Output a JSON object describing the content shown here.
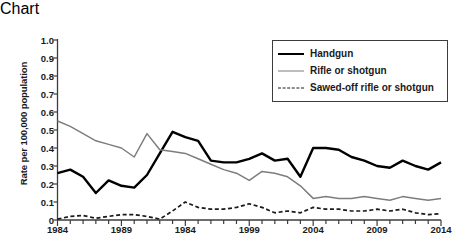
{
  "chart_data": {
    "type": "line",
    "title": "",
    "xlabel": "",
    "ylabel": "Rate per 100,000 population",
    "ylim": [
      0,
      1.0
    ],
    "xlim": [
      1984,
      2014
    ],
    "grid": false,
    "legend_position": "top-right",
    "y_ticks": [
      "1.0",
      "0.9",
      "0.8",
      "0.7",
      "0.6",
      "0.5",
      "0.4",
      "0.3",
      "0.2",
      "0.1",
      "0"
    ],
    "y_tick_values": [
      1.0,
      0.9,
      0.8,
      0.7,
      0.6,
      0.5,
      0.4,
      0.3,
      0.2,
      0.1,
      0
    ],
    "x_tick_labels": [
      "1984",
      "1989",
      "1984",
      "1999",
      "2004",
      "2009",
      "2014"
    ],
    "x_tick_values": [
      1984,
      1989,
      1994,
      1999,
      2004,
      2009,
      2014
    ],
    "x": [
      1984,
      1985,
      1986,
      1987,
      1988,
      1989,
      1990,
      1991,
      1992,
      1993,
      1994,
      1995,
      1996,
      1997,
      1998,
      1999,
      2000,
      2001,
      2002,
      2003,
      2004,
      2005,
      2006,
      2007,
      2008,
      2009,
      2010,
      2011,
      2012,
      2013,
      2014
    ],
    "series": [
      {
        "name": "Handgun",
        "color": "#000000",
        "style": "solid-thick",
        "values": [
          0.26,
          0.28,
          0.24,
          0.15,
          0.22,
          0.19,
          0.18,
          0.25,
          0.37,
          0.49,
          0.46,
          0.44,
          0.33,
          0.32,
          0.32,
          0.34,
          0.37,
          0.33,
          0.34,
          0.24,
          0.3,
          0.36,
          0.36,
          0.33,
          0.32,
          0.35,
          0.36,
          0.36,
          0.42,
          0.35,
          0.38
        ]
      },
      {
        "name": "Rifle or shotgun",
        "color": "#7d7d7d",
        "style": "solid-thin",
        "values": [
          0.55,
          0.52,
          0.48,
          0.44,
          0.42,
          0.4,
          0.35,
          0.48,
          0.39,
          0.38,
          0.37,
          0.34,
          0.31,
          0.28,
          0.26,
          0.22,
          0.27,
          0.26,
          0.24,
          0.19,
          0.18,
          0.2,
          0.2,
          0.17,
          0.15,
          0.13,
          0.12,
          0.14,
          0.19,
          0.13,
          0.12
        ]
      },
      {
        "name": "Sawed-off rifle or shotgun",
        "color": "#1a1a1a",
        "style": "dashed",
        "values": [
          0.005,
          0.02,
          0.025,
          0.01,
          0.02,
          0.03,
          0.03,
          0.02,
          0.005,
          0.05,
          0.1,
          0.07,
          0.06,
          0.06,
          0.07,
          0.09,
          0.07,
          0.04,
          0.05,
          0.04,
          0.05,
          0.03,
          0.03,
          0.02,
          0.02,
          0.03,
          0.05,
          0.06,
          0.04,
          0.07,
          0.09
        ]
      }
    ],
    "series_tail": {
      "Handgun": [
        0.4,
        0.4,
        0.39,
        0.35,
        0.33,
        0.3,
        0.29,
        0.33,
        0.3,
        0.28,
        0.32
      ],
      "Rifle or shotgun": [
        0.12,
        0.13,
        0.12,
        0.12,
        0.13,
        0.12,
        0.11,
        0.13,
        0.12,
        0.11,
        0.12
      ],
      "Sawed-off rifle or shotgun": [
        0.07,
        0.06,
        0.06,
        0.05,
        0.05,
        0.06,
        0.05,
        0.06,
        0.04,
        0.03,
        0.035
      ]
    }
  },
  "legend": {
    "items": [
      {
        "label": "Handgun"
      },
      {
        "label": "Rifle or shotgun"
      },
      {
        "label": "Sawed-off rifle or shotgun"
      }
    ]
  },
  "axis": {
    "y_title": "Rate per 100,000 population"
  }
}
